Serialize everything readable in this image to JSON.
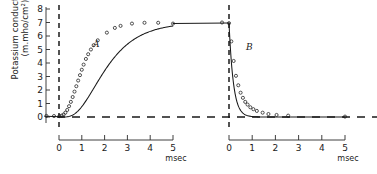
{
  "figure": {
    "yaxis": {
      "label_line1": "Potassium conductance",
      "label_line2": "(m.mho/cm²)",
      "ticks": [
        "8",
        "7",
        "6",
        "5",
        "4",
        "3",
        "2",
        "1",
        "0"
      ],
      "min": 0,
      "max": 8
    },
    "panels": [
      {
        "id": "A",
        "label": "A",
        "xlabel": "msec",
        "xticks": [
          "0",
          "1",
          "2",
          "3",
          "4",
          "5"
        ],
        "xmin": 0,
        "xmax": 5
      },
      {
        "id": "B",
        "label": "B",
        "xlabel": "msec",
        "xticks": [
          "0",
          "1",
          "2",
          "3",
          "4",
          "5"
        ],
        "xmin": 0,
        "xmax": 5
      }
    ]
  },
  "chart_data": {
    "type": "line",
    "title": "",
    "xlabel": "msec",
    "ylabel": "Potassium conductance (m.mho/cm²)",
    "ylim": [
      0,
      8
    ],
    "grid": false,
    "legend": false,
    "annotations": [
      "A",
      "B"
    ],
    "series": [
      {
        "name": "A",
        "panel": "A",
        "xlim": [
          0,
          5
        ],
        "marker": "open-circle",
        "points": [
          {
            "x": -0.55,
            "y": 0.08
          },
          {
            "x": -0.22,
            "y": 0.07
          },
          {
            "x": 0.02,
            "y": 0.07
          },
          {
            "x": 0.12,
            "y": 0.1
          },
          {
            "x": 0.2,
            "y": 0.18
          },
          {
            "x": 0.28,
            "y": 0.32
          },
          {
            "x": 0.36,
            "y": 0.52
          },
          {
            "x": 0.44,
            "y": 0.8
          },
          {
            "x": 0.52,
            "y": 1.12
          },
          {
            "x": 0.6,
            "y": 1.48
          },
          {
            "x": 0.68,
            "y": 1.88
          },
          {
            "x": 0.76,
            "y": 2.28
          },
          {
            "x": 0.84,
            "y": 2.7
          },
          {
            "x": 0.92,
            "y": 3.1
          },
          {
            "x": 1.0,
            "y": 3.5
          },
          {
            "x": 1.08,
            "y": 3.88
          },
          {
            "x": 1.18,
            "y": 4.3
          },
          {
            "x": 1.28,
            "y": 4.65
          },
          {
            "x": 1.4,
            "y": 5.0
          },
          {
            "x": 1.52,
            "y": 5.32
          },
          {
            "x": 1.7,
            "y": 5.68
          },
          {
            "x": 2.1,
            "y": 6.25
          },
          {
            "x": 2.45,
            "y": 6.6
          },
          {
            "x": 2.7,
            "y": 6.75
          },
          {
            "x": 3.2,
            "y": 6.92
          },
          {
            "x": 3.75,
            "y": 6.98
          },
          {
            "x": 4.35,
            "y": 6.98
          },
          {
            "x": 5.0,
            "y": 6.92
          }
        ],
        "fit_curve": {
          "model": "n^4 rise",
          "g_max": 7.0,
          "tau_n": 1.05,
          "delay": 0.1
        }
      },
      {
        "name": "B",
        "panel": "B",
        "xlim": [
          0,
          5
        ],
        "marker": "open-circle",
        "points": [
          {
            "x": -0.3,
            "y": 7.0
          },
          {
            "x": 0.0,
            "y": 6.95
          },
          {
            "x": 0.1,
            "y": 5.6
          },
          {
            "x": 0.2,
            "y": 4.15
          },
          {
            "x": 0.3,
            "y": 3.05
          },
          {
            "x": 0.4,
            "y": 2.35
          },
          {
            "x": 0.5,
            "y": 1.8
          },
          {
            "x": 0.6,
            "y": 1.42
          },
          {
            "x": 0.7,
            "y": 1.12
          },
          {
            "x": 0.8,
            "y": 0.92
          },
          {
            "x": 0.92,
            "y": 0.72
          },
          {
            "x": 1.05,
            "y": 0.58
          },
          {
            "x": 1.2,
            "y": 0.45
          },
          {
            "x": 1.45,
            "y": 0.32
          },
          {
            "x": 1.7,
            "y": 0.22
          },
          {
            "x": 2.05,
            "y": 0.15
          },
          {
            "x": 2.55,
            "y": 0.1
          },
          {
            "x": 5.0,
            "y": 0.03
          }
        ],
        "fit_curve": {
          "model": "n^4 decay",
          "g_max": 7.0,
          "tau_n": 0.32
        }
      }
    ]
  }
}
